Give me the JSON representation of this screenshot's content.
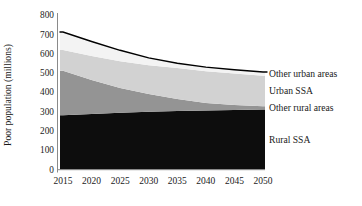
{
  "figure": {
    "background": "#ffffff",
    "text_color": "#1a1a1a",
    "axis_color": "#8a8a8a"
  },
  "chart_data": {
    "type": "area",
    "stacked": true,
    "title": "",
    "xlabel": "",
    "ylabel": "Poor population (millions)",
    "ylim": [
      0,
      800
    ],
    "y_ticks": [
      0,
      100,
      200,
      300,
      400,
      500,
      600,
      700,
      800
    ],
    "x": [
      2015,
      2020,
      2025,
      2030,
      2035,
      2040,
      2045,
      2050
    ],
    "grid": false,
    "legend_position": "right-inline-labels",
    "series": [
      {
        "name": "Rural SSA",
        "color": "#0d0d0d",
        "values": [
          281,
          288,
          294,
          299,
          303,
          306,
          308,
          310
        ]
      },
      {
        "name": "Other rural areas",
        "color": "#949494",
        "values": [
          230,
          176,
          128,
          92,
          62,
          39,
          26,
          17
        ]
      },
      {
        "name": "Urban SSA",
        "color": "#d2d2d2",
        "values": [
          107,
          123,
          139,
          149,
          160,
          164,
          163,
          158
        ]
      },
      {
        "name": "Other urban areas",
        "color": "#f3f3f3",
        "values": [
          94,
          76,
          56,
          38,
          25,
          21,
          19,
          20
        ]
      }
    ],
    "total_line": {
      "color": "#000000",
      "width": 1.4,
      "totals": [
        712,
        663,
        617,
        578,
        550,
        530,
        516,
        505
      ]
    }
  }
}
